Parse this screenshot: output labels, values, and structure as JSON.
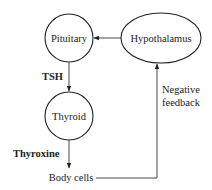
{
  "diagram": {
    "type": "flowchart",
    "nodes": [
      {
        "id": "pituitary",
        "label": "Pituitary",
        "shape": "circle"
      },
      {
        "id": "hypothalamus",
        "label": "Hypothalamus",
        "shape": "ellipse"
      },
      {
        "id": "thyroid",
        "label": "Thyroid",
        "shape": "circle"
      },
      {
        "id": "body_cells",
        "label": "Body cells",
        "shape": "text"
      }
    ],
    "edges": [
      {
        "from": "hypothalamus",
        "to": "pituitary",
        "label": ""
      },
      {
        "from": "pituitary",
        "to": "thyroid",
        "label": "TSH"
      },
      {
        "from": "thyroid",
        "to": "body_cells",
        "label": "Thyroxine"
      },
      {
        "from": "body_cells",
        "to": "hypothalamus",
        "label": "Negative feedback"
      }
    ],
    "labels": {
      "pituitary": "Pituitary",
      "hypothalamus": "Hypothalamus",
      "thyroid": "Thyroid",
      "body_cells": "Body cells",
      "tsh": "TSH",
      "thyroxine": "Thyroxine",
      "feedback_line1": "Negative",
      "feedback_line2": "feedback"
    },
    "colors": {
      "stroke": "#222222",
      "text": "#222222",
      "background": "#ffffff"
    }
  }
}
